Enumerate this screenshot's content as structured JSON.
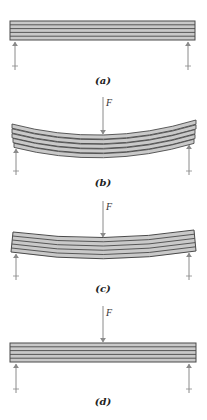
{
  "figure": {
    "colors": {
      "beam_fill": "#c9c9c9",
      "beam_line": "#4a4a4a",
      "arrow": "#8a8a8a",
      "label": "#222222"
    },
    "panels": [
      {
        "id": "a",
        "label": "(a)",
        "has_load": false,
        "force_label": "",
        "state": "unloaded straight layers"
      },
      {
        "id": "b",
        "label": "(b)",
        "has_load": true,
        "force_label": "F",
        "state": "bent, layers slip (staggered ends)"
      },
      {
        "id": "c",
        "label": "(c)",
        "has_load": true,
        "force_label": "F",
        "state": "bent, layers glued (flush slanted ends)"
      },
      {
        "id": "d",
        "label": "(d)",
        "has_load": true,
        "force_label": "F",
        "state": "solid beam, no visible bending"
      }
    ]
  }
}
